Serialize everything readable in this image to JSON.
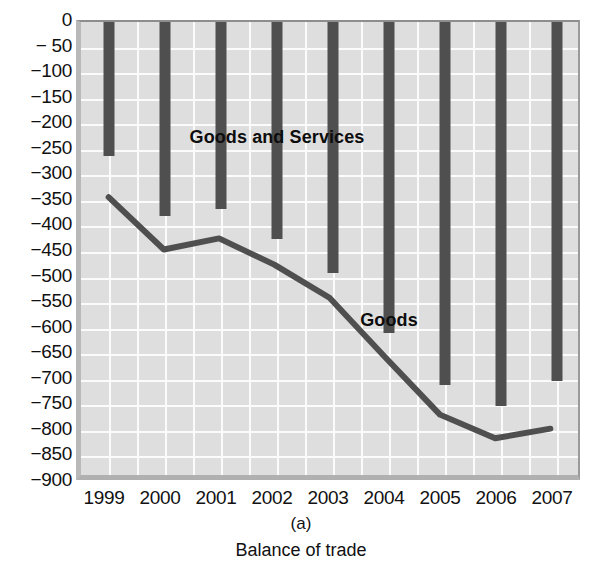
{
  "chart_data": {
    "type": "bar",
    "title": "Balance of trade",
    "panel_letter": "(a)",
    "xlabel": "",
    "ylabel": "",
    "categories": [
      "1999",
      "2000",
      "2001",
      "2002",
      "2003",
      "2004",
      "2005",
      "2006",
      "2007"
    ],
    "ylim": [
      -900,
      0
    ],
    "ytick_step": 50,
    "yticks": [
      0,
      -50,
      -100,
      -150,
      -200,
      -250,
      -300,
      -350,
      -400,
      -450,
      -500,
      -550,
      -600,
      -650,
      -700,
      -750,
      -800,
      -850,
      -900
    ],
    "ytick_labels": [
      "0",
      "− 50",
      "−100",
      "−150",
      "−200",
      "−250",
      "−300",
      "−350",
      "−400",
      "−450",
      "−500",
      "−550",
      "−600",
      "−650",
      "−700",
      "−750",
      "−800",
      "−850",
      "−900"
    ],
    "grid": true,
    "legend": "in-plot-labels",
    "series": [
      {
        "name": "Goods and Services",
        "render": "bar",
        "color": "#4f4f4f",
        "label_x_category": "2002",
        "label_y_value": -225,
        "values": [
          -263,
          -380,
          -365,
          -425,
          -492,
          -608,
          -710,
          -752,
          -702
        ]
      },
      {
        "name": "Goods",
        "render": "line",
        "color": "#4f4f4f",
        "label_x_category": "2004",
        "label_y_value": -583,
        "values": [
          -348,
          -452,
          -430,
          -482,
          -548,
          -665,
          -780,
          -827,
          -808
        ]
      }
    ]
  }
}
